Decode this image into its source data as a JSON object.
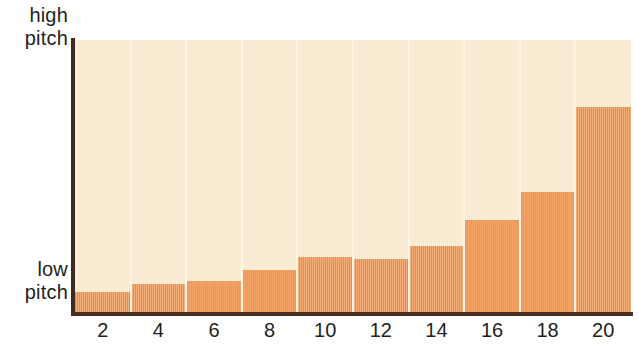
{
  "axes": {
    "y_high_label_line1": "high",
    "y_high_label_line2": "pitch",
    "y_low_label_line1": "low",
    "y_low_label_line2": "pitch"
  },
  "colors": {
    "bar": "#F08A3C",
    "plot_background": "#FBE9C9",
    "gridline": "#FDF3E0",
    "axis": "#3D2B22",
    "text": "#231F20"
  },
  "chart_data": {
    "type": "bar",
    "title": "",
    "subtitle": "",
    "xlabel": "",
    "ylabel": "pitch",
    "grid": true,
    "legend": null,
    "xlim": [
      0,
      21
    ],
    "ylim": [
      0,
      100
    ],
    "x_tick_labels": [
      "2",
      "4",
      "6",
      "8",
      "10",
      "12",
      "14",
      "16",
      "18",
      "20"
    ],
    "x_tick_values": [
      2,
      4,
      6,
      8,
      10,
      12,
      14,
      16,
      18,
      20
    ],
    "y_tick_labels": [
      "low pitch",
      "high pitch"
    ],
    "y_axis_description": "low pitch at bottom, high pitch at top (unlabeled numeric scale)",
    "categories": [
      "2",
      "4",
      "6",
      "8",
      "10",
      "12",
      "14",
      "16",
      "18",
      "20"
    ],
    "values": [
      7.7,
      10.6,
      11.7,
      15.8,
      20.5,
      19.8,
      24.5,
      34.1,
      44.3,
      75.5
    ],
    "bar_top_pixels": [
      292,
      284,
      281,
      270,
      257,
      259,
      246,
      220,
      192,
      107
    ],
    "annotation": "Stepped bar chart: pitch rises slowly then sharply, exponential-like growth from left to right"
  }
}
